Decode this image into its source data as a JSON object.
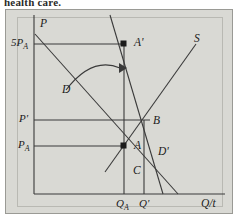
{
  "caption": {
    "cropped_text": "health care."
  },
  "figure": {
    "background_color": "#d9d9d4",
    "frame_border_color": "#9a9a95",
    "line_color": "#3a3a3a",
    "text_color": "#1b1b1b"
  },
  "axes": {
    "y_axis_label": "P",
    "x_axis_label": "Q/t",
    "y_ticks": [
      {
        "label_main": "5P",
        "label_sub": "A",
        "value_y": 44
      },
      {
        "label_main": "P'",
        "label_sub": "",
        "value_y": 120
      },
      {
        "label_main": "P",
        "label_sub": "A",
        "value_y": 146
      }
    ],
    "x_ticks": [
      {
        "label_main": "Q",
        "label_sub": "A",
        "value_x": 124
      },
      {
        "label_main": "Q'",
        "label_sub": "",
        "value_x": 144
      }
    ]
  },
  "curves": [
    {
      "name": "demand-original",
      "label_main": "D",
      "label_sub": ""
    },
    {
      "name": "demand-shifted",
      "label_main": "D'",
      "label_sub": ""
    },
    {
      "name": "supply",
      "label_main": "S",
      "label_sub": ""
    }
  ],
  "points": [
    {
      "name": "point-A-prime",
      "label_main": "A'",
      "marker": true
    },
    {
      "name": "point-B",
      "label_main": "B",
      "marker": false
    },
    {
      "name": "point-A",
      "label_main": "A",
      "marker": true
    },
    {
      "name": "point-C",
      "label_main": "C",
      "marker": false
    }
  ],
  "annotations": {
    "shift_arrow": "curved-shift-arrow"
  }
}
